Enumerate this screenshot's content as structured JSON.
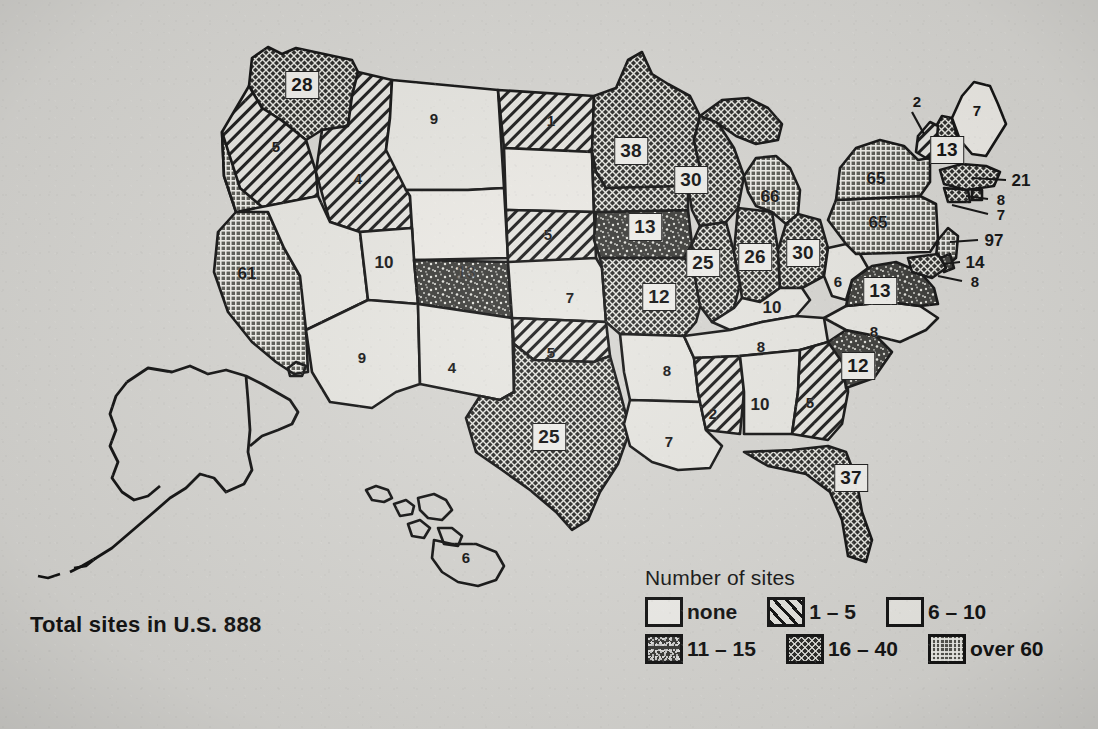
{
  "figure": {
    "kind": "choropleth-map",
    "region": "United States",
    "total_caption": "Total sites in U.S. 888",
    "background_color": "#d7d6d2",
    "ink_color": "#141414"
  },
  "legend": {
    "title": "Number of sites",
    "rows": [
      [
        {
          "key": "none",
          "label": "none",
          "pattern": "p-none"
        },
        {
          "key": "1-5",
          "label": "1 – 5",
          "pattern": "p-1-5"
        },
        {
          "key": "6-10",
          "label": "6 – 10",
          "pattern": "p-6-10"
        }
      ],
      [
        {
          "key": "11-15",
          "label": "11 – 15",
          "pattern": "p-11-15"
        },
        {
          "key": "16-40",
          "label": "16 – 40",
          "pattern": "p-16-40"
        },
        {
          "key": "over60",
          "label": "over 60",
          "pattern": "p-over60"
        }
      ]
    ]
  },
  "chart_data": {
    "type": "map",
    "title": "Number of sites",
    "annotation": "Total sites in U.S. 888",
    "total": 888,
    "value_label": "Number of sites",
    "classes": [
      {
        "key": "none",
        "label": "none",
        "min": 0,
        "max": 0
      },
      {
        "key": "1-5",
        "label": "1 – 5",
        "min": 1,
        "max": 5
      },
      {
        "key": "6-10",
        "label": "6 – 10",
        "min": 6,
        "max": 10
      },
      {
        "key": "11-15",
        "label": "11 – 15",
        "min": 11,
        "max": 15
      },
      {
        "key": "16-40",
        "label": "16 – 40",
        "min": 16,
        "max": 40
      },
      {
        "key": "over60",
        "label": "over 60",
        "min": 60,
        "max": null
      }
    ],
    "regions": [
      {
        "code": "WA",
        "name": "Washington",
        "value": 28,
        "class": "16-40"
      },
      {
        "code": "OR",
        "name": "Oregon",
        "value": 5,
        "class": "1-5"
      },
      {
        "code": "ID",
        "name": "Idaho",
        "value": 4,
        "class": "1-5"
      },
      {
        "code": "MT",
        "name": "Montana",
        "value": 9,
        "class": "6-10"
      },
      {
        "code": "WY",
        "name": "Wyoming",
        "value": 0,
        "class": "none"
      },
      {
        "code": "ND",
        "name": "North Dakota",
        "value": 1,
        "class": "1-5"
      },
      {
        "code": "SD",
        "name": "South Dakota",
        "value": 0,
        "class": "none"
      },
      {
        "code": "NE",
        "name": "Nebraska",
        "value": 5,
        "class": "1-5"
      },
      {
        "code": "CA",
        "name": "California",
        "value": 61,
        "class": "over60"
      },
      {
        "code": "NV",
        "name": "Nevada",
        "value": 10,
        "class": "6-10"
      },
      {
        "code": "UT",
        "name": "Utah",
        "value": 10,
        "class": "6-10"
      },
      {
        "code": "CO",
        "name": "Colorado",
        "value": 13,
        "class": "11-15"
      },
      {
        "code": "AZ",
        "name": "Arizona",
        "value": 9,
        "class": "6-10"
      },
      {
        "code": "NM",
        "name": "New Mexico",
        "value": 4,
        "class": "6-10"
      },
      {
        "code": "KS",
        "name": "Kansas",
        "value": 7,
        "class": "6-10"
      },
      {
        "code": "OK",
        "name": "Oklahoma",
        "value": 5,
        "class": "1-5"
      },
      {
        "code": "TX",
        "name": "Texas",
        "value": 25,
        "class": "16-40"
      },
      {
        "code": "MN",
        "name": "Minnesota",
        "value": 38,
        "class": "16-40"
      },
      {
        "code": "IA",
        "name": "Iowa",
        "value": 13,
        "class": "11-15"
      },
      {
        "code": "MO",
        "name": "Missouri",
        "value": 12,
        "class": "16-40"
      },
      {
        "code": "AR",
        "name": "Arkansas",
        "value": 8,
        "class": "6-10"
      },
      {
        "code": "LA",
        "name": "Louisiana",
        "value": 7,
        "class": "6-10"
      },
      {
        "code": "WI",
        "name": "Wisconsin",
        "value": 30,
        "class": "16-40"
      },
      {
        "code": "IL",
        "name": "Illinois",
        "value": 25,
        "class": "16-40"
      },
      {
        "code": "IN",
        "name": "Indiana",
        "value": 26,
        "class": "16-40"
      },
      {
        "code": "MI",
        "name": "Michigan",
        "value": 66,
        "class": "over60"
      },
      {
        "code": "OH",
        "name": "Ohio",
        "value": 30,
        "class": "16-40"
      },
      {
        "code": "KY",
        "name": "Kentucky",
        "value": 10,
        "class": "6-10"
      },
      {
        "code": "TN",
        "name": "Tennessee",
        "value": 8,
        "class": "6-10"
      },
      {
        "code": "MS",
        "name": "Mississippi",
        "value": 2,
        "class": "1-5"
      },
      {
        "code": "AL",
        "name": "Alabama",
        "value": 10,
        "class": "6-10"
      },
      {
        "code": "GA",
        "name": "Georgia",
        "value": 5,
        "class": "1-5"
      },
      {
        "code": "FL",
        "name": "Florida",
        "value": 37,
        "class": "16-40"
      },
      {
        "code": "SC",
        "name": "South Carolina",
        "value": 12,
        "class": "11-15"
      },
      {
        "code": "NC",
        "name": "North Carolina",
        "value": 8,
        "class": "6-10"
      },
      {
        "code": "VA",
        "name": "Virginia",
        "value": 13,
        "class": "11-15"
      },
      {
        "code": "WV",
        "name": "West Virginia",
        "value": 6,
        "class": "6-10"
      },
      {
        "code": "MD",
        "name": "Maryland",
        "value": 8,
        "class": "6-10"
      },
      {
        "code": "DE",
        "name": "Delaware",
        "value": 14,
        "class": "11-15"
      },
      {
        "code": "PA",
        "name": "Pennsylvania",
        "value": 65,
        "class": "over60"
      },
      {
        "code": "NJ",
        "name": "New Jersey",
        "value": 97,
        "class": "over60"
      },
      {
        "code": "NY",
        "name": "New York",
        "value": 65,
        "class": "over60"
      },
      {
        "code": "CT",
        "name": "Connecticut",
        "value": 7,
        "class": "6-10"
      },
      {
        "code": "RI",
        "name": "Rhode Island",
        "value": 8,
        "class": "6-10"
      },
      {
        "code": "MA",
        "name": "Massachusetts",
        "value": 21,
        "class": "16-40"
      },
      {
        "code": "VT",
        "name": "Vermont",
        "value": 2,
        "class": "1-5"
      },
      {
        "code": "NH",
        "name": "New Hampshire",
        "value": 13,
        "class": "11-15"
      },
      {
        "code": "ME",
        "name": "Maine",
        "value": 7,
        "class": "6-10"
      },
      {
        "code": "AK",
        "name": "Alaska",
        "value": 0,
        "class": "none"
      },
      {
        "code": "HI",
        "name": "Hawaii",
        "value": 6,
        "class": "6-10"
      }
    ]
  },
  "labels": {
    "boxed": [
      {
        "name": "WA",
        "text": "28",
        "x": 302,
        "y": 85
      },
      {
        "name": "MN",
        "text": "38",
        "x": 631,
        "y": 151
      },
      {
        "name": "WI",
        "text": "30",
        "x": 691,
        "y": 180
      },
      {
        "name": "IA",
        "text": "13",
        "x": 645,
        "y": 227
      },
      {
        "name": "IL",
        "text": "25",
        "x": 703,
        "y": 263
      },
      {
        "name": "IN",
        "text": "26",
        "x": 755,
        "y": 257
      },
      {
        "name": "OH",
        "text": "30",
        "x": 803,
        "y": 253
      },
      {
        "name": "MO",
        "text": "12",
        "x": 659,
        "y": 297
      },
      {
        "name": "TX",
        "text": "25",
        "x": 549,
        "y": 437
      },
      {
        "name": "NH",
        "text": "13",
        "x": 947,
        "y": 150
      },
      {
        "name": "VA",
        "text": "13",
        "x": 880,
        "y": 291
      },
      {
        "name": "SC",
        "text": "12",
        "x": 858,
        "y": 366
      },
      {
        "name": "FL",
        "text": "37",
        "x": 851,
        "y": 478
      }
    ],
    "plain": [
      {
        "name": "OR",
        "text": "5",
        "x": 276,
        "y": 146
      },
      {
        "name": "ID",
        "text": "4",
        "x": 358,
        "y": 178
      },
      {
        "name": "MT",
        "text": "9",
        "x": 434,
        "y": 118
      },
      {
        "name": "ND",
        "text": "1",
        "x": 551,
        "y": 120
      },
      {
        "name": "NE",
        "text": "5",
        "x": 548,
        "y": 234
      },
      {
        "name": "KS",
        "text": "7",
        "x": 570,
        "y": 297
      },
      {
        "name": "CA",
        "text": "61",
        "x": 247,
        "y": 273
      },
      {
        "name": "NV",
        "text": "10",
        "x": 384,
        "y": 262
      },
      {
        "name": "AZ",
        "text": "9",
        "x": 362,
        "y": 357
      },
      {
        "name": "NM",
        "text": "4",
        "x": 452,
        "y": 367
      },
      {
        "name": "OK",
        "text": "5",
        "x": 551,
        "y": 352
      },
      {
        "name": "AR",
        "text": "8",
        "x": 667,
        "y": 370
      },
      {
        "name": "LA",
        "text": "7",
        "x": 669,
        "y": 441
      },
      {
        "name": "MS",
        "text": "2",
        "x": 713,
        "y": 413
      },
      {
        "name": "AL",
        "text": "10",
        "x": 760,
        "y": 404
      },
      {
        "name": "GA",
        "text": "5",
        "x": 810,
        "y": 402
      },
      {
        "name": "TN",
        "text": "8",
        "x": 761,
        "y": 346
      },
      {
        "name": "KY",
        "text": "10",
        "x": 772,
        "y": 307
      },
      {
        "name": "NC",
        "text": "8",
        "x": 874,
        "y": 331
      },
      {
        "name": "WV",
        "text": "6",
        "x": 838,
        "y": 281
      },
      {
        "name": "MI",
        "text": "66",
        "x": 770,
        "y": 196
      },
      {
        "name": "NY",
        "text": "65",
        "x": 876,
        "y": 178
      },
      {
        "name": "PA",
        "text": "65",
        "x": 878,
        "y": 222
      },
      {
        "name": "ME",
        "text": "7",
        "x": 977,
        "y": 110
      },
      {
        "name": "VT",
        "text": "2",
        "x": 917,
        "y": 101
      },
      {
        "name": "MA",
        "text": "21",
        "x": 1021,
        "y": 180
      },
      {
        "name": "RI",
        "text": "8",
        "x": 1001,
        "y": 199
      },
      {
        "name": "CT",
        "text": "7",
        "x": 1001,
        "y": 214
      },
      {
        "name": "NJ",
        "text": "97",
        "x": 994,
        "y": 240
      },
      {
        "name": "DE",
        "text": "14",
        "x": 975,
        "y": 262
      },
      {
        "name": "MD",
        "text": "8",
        "x": 975,
        "y": 281
      },
      {
        "name": "HI",
        "text": "6",
        "x": 466,
        "y": 557
      }
    ],
    "obscured": [
      {
        "name": "CO",
        "text": "13",
        "x": 466,
        "y": 272
      }
    ]
  }
}
